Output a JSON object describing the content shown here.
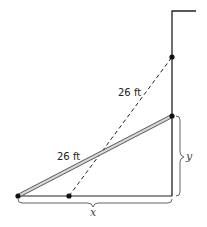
{
  "diagram": {
    "type": "ladder-against-wall",
    "labels": {
      "ladder_top_length": "26 ft",
      "ladder_bottom_length": "26 ft",
      "height_var": "y",
      "distance_var": "x"
    },
    "points": {
      "wall_top": [
        172,
        11
      ],
      "wall_corner_right": [
        196,
        11
      ],
      "ladder1_top": [
        172,
        57
      ],
      "ladder2_top": [
        172,
        116
      ],
      "ground_right": [
        172,
        196
      ],
      "ladder2_foot": [
        18,
        196
      ],
      "ladder1_foot": [
        69,
        196
      ]
    },
    "colors": {
      "line": "#222222",
      "ladder_fill": "#cccccc",
      "brace": "#555555"
    }
  }
}
